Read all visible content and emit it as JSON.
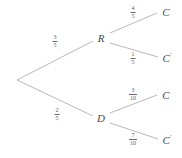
{
  "diagram": {
    "type": "probability-tree",
    "line_color": "#9a9a9a",
    "text_color": "#4a4a4a",
    "background_color": "#ffffff"
  },
  "nodes": {
    "root": {
      "label": "",
      "x": 17,
      "y": 80
    },
    "r": {
      "label": "R",
      "x": 101,
      "y": 38
    },
    "d": {
      "label": "D",
      "x": 101,
      "y": 118
    }
  },
  "leaves": [
    {
      "label": "C",
      "prime": "",
      "x": 166,
      "y": 12
    },
    {
      "label": "C",
      "prime": "′",
      "x": 167,
      "y": 58
    },
    {
      "label": "C",
      "prime": "",
      "x": 166,
      "y": 95
    },
    {
      "label": "C",
      "prime": "′",
      "x": 167,
      "y": 140
    }
  ],
  "branches": [
    {
      "name": "root-to-r",
      "numerator": "3",
      "denominator": "5",
      "label_x": 55,
      "label_y": 41,
      "from_x": 17,
      "from_y": 80,
      "to_x": 93,
      "to_y": 41
    },
    {
      "name": "root-to-d",
      "numerator": "2",
      "denominator": "5",
      "label_x": 57,
      "label_y": 114,
      "from_x": 17,
      "from_y": 80,
      "to_x": 93,
      "to_y": 116
    },
    {
      "name": "r-to-c",
      "numerator": "4",
      "denominator": "5",
      "label_x": 133,
      "label_y": 12,
      "from_x": 110,
      "from_y": 33,
      "to_x": 157,
      "to_y": 13
    },
    {
      "name": "r-to-cprime",
      "numerator": "1",
      "denominator": "5",
      "label_x": 133,
      "label_y": 58,
      "from_x": 110,
      "from_y": 43,
      "to_x": 158,
      "to_y": 57
    },
    {
      "name": "d-to-c",
      "numerator": "3",
      "denominator": "10",
      "label_x": 133,
      "label_y": 94,
      "from_x": 110,
      "from_y": 113,
      "to_x": 157,
      "to_y": 95
    },
    {
      "name": "d-to-cprime",
      "numerator": "7",
      "denominator": "10",
      "label_x": 133,
      "label_y": 139,
      "from_x": 110,
      "from_y": 123,
      "to_x": 158,
      "to_y": 139
    }
  ]
}
